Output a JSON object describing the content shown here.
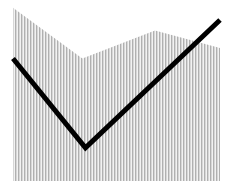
{
  "chart_data": {
    "type": "area",
    "title": "",
    "xlabel": "",
    "ylabel": "",
    "xlim": [
      0,
      1
    ],
    "ylim": [
      0,
      100
    ],
    "grid": false,
    "legend": "none",
    "series": [
      {
        "name": "area",
        "kind": "area",
        "fill": "#b4b4b4",
        "pattern": "vertical-hatch",
        "x": [
          0,
          0.335,
          0.686,
          1.0
        ],
        "values": [
          99,
          70,
          86,
          76
        ]
      },
      {
        "name": "line",
        "kind": "line",
        "color": "#000000",
        "x": [
          0,
          0.35,
          1.0
        ],
        "values": [
          70,
          19,
          92
        ]
      }
    ]
  }
}
